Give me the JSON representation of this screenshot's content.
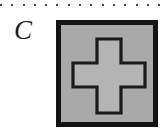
{
  "figure": {
    "panel_label": "C",
    "separator": {
      "name": "dotted-rule",
      "dot_count": 15,
      "dot_color": "#4a4a4a"
    },
    "square": {
      "name": "gray-square",
      "fill_color": "#a9a9a9",
      "border_color": "#141414",
      "border_width_px": 5
    },
    "cross": {
      "name": "plus-shape",
      "fill_color": "#b4b4b4",
      "outline_color": "#1a1a1a",
      "outline_width_px": 3
    }
  }
}
